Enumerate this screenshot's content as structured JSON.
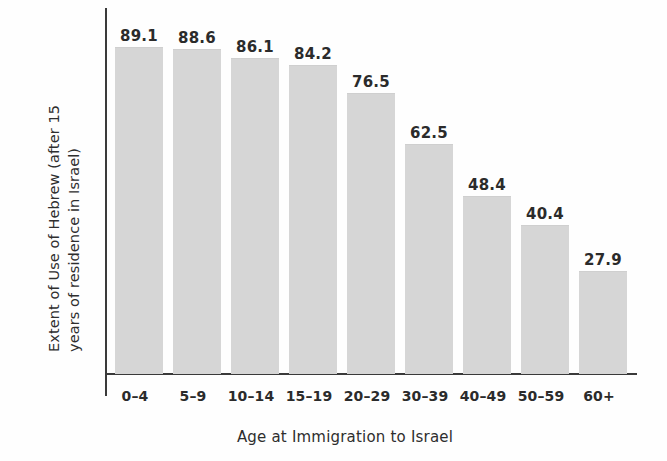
{
  "chart_data": {
    "type": "bar",
    "title": "",
    "xlabel": "Age at Immigration to Israel",
    "ylabel_line1": "Extent of Use of Hebrew (after 15",
    "ylabel_line2": "years of residence in Israel)",
    "ylabel": "Extent of Use of Hebrew (after 15 years of residence in Israel)",
    "categories": [
      "0–4",
      "5–9",
      "10–14",
      "15–19",
      "20–29",
      "30–39",
      "40–49",
      "50–59",
      "60+"
    ],
    "values": [
      89.1,
      88.6,
      86.1,
      84.2,
      76.5,
      62.5,
      48.4,
      40.4,
      27.9
    ],
    "value_labels": [
      "89.1",
      "88.6",
      "86.1",
      "84.2",
      "76.5",
      "62.5",
      "48.4",
      "40.4",
      "27.9"
    ],
    "ylim": [
      0,
      100
    ],
    "grid": false,
    "legend": false,
    "legend_position": "none",
    "bar_color": "#d6d6d6",
    "axis_color": "#3a3a3a",
    "text_color": "#2b2b2b",
    "background_color": "#fefefe"
  }
}
